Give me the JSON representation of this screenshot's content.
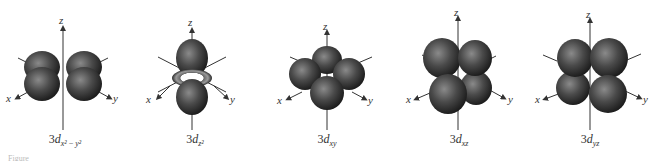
{
  "figure": {
    "panels": [
      {
        "id": "dx2-y2",
        "prefix": "3",
        "letter": "d",
        "subscript": "x² − y²",
        "axes": {
          "z": "z",
          "x": "x",
          "y": "y"
        }
      },
      {
        "id": "dz2",
        "prefix": "3",
        "letter": "d",
        "subscript": "z²",
        "axes": {
          "z": "z",
          "x": "x",
          "y": "y"
        }
      },
      {
        "id": "dxy",
        "prefix": "3",
        "letter": "d",
        "subscript": "xy",
        "axes": {
          "z": "z",
          "x": "x",
          "y": "y"
        }
      },
      {
        "id": "dxz",
        "prefix": "3",
        "letter": "d",
        "subscript": "xz",
        "axes": {
          "z": "z",
          "x": "x",
          "y": "y"
        }
      },
      {
        "id": "dyz",
        "prefix": "3",
        "letter": "d",
        "subscript": "yz",
        "axes": {
          "z": "z",
          "x": "x",
          "y": "y"
        }
      }
    ],
    "caption_fragment": "Figure",
    "colors": {
      "lobe_dark": "#1a1a1a",
      "lobe_mid": "#4a4a4a",
      "lobe_highlight": "#8a8a8a",
      "axis": "#333333"
    }
  }
}
